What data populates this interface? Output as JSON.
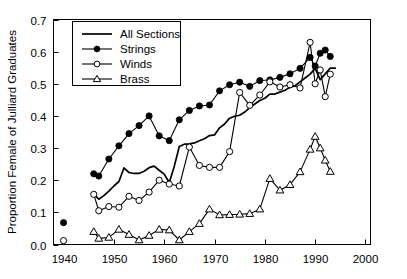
{
  "chart_data": {
    "type": "line",
    "title": "",
    "xlabel": "",
    "ylabel": "Proportion Female of Julliard Graduates",
    "xlim": [
      1938,
      2001
    ],
    "ylim": [
      0.0,
      0.7
    ],
    "grid": false,
    "legend_position": "top-left-inside",
    "x_ticks": [
      1940,
      1950,
      1960,
      1970,
      1980,
      1990,
      2000
    ],
    "x_tick_labels": [
      "1940",
      "1950",
      "1960",
      "1970",
      "1980",
      "1990",
      "2000"
    ],
    "y_ticks": [
      0.0,
      0.1,
      0.2,
      0.3,
      0.4,
      0.5,
      0.6,
      0.7
    ],
    "y_tick_labels": [
      "0.0",
      "0.1",
      "0.2",
      "0.3",
      "0.4",
      "0.5",
      "0.6",
      "0.7"
    ],
    "series": [
      {
        "name": "All Sections",
        "marker": "none",
        "x": [
          1946,
          1947,
          1948,
          1949,
          1950,
          1951,
          1952,
          1953,
          1954,
          1955,
          1956,
          1957,
          1958,
          1959,
          1960,
          1961,
          1962,
          1963,
          1964,
          1965,
          1966,
          1967,
          1968,
          1969,
          1970,
          1971,
          1972,
          1973,
          1974,
          1975,
          1976,
          1977,
          1978,
          1979,
          1980,
          1981,
          1982,
          1983,
          1984,
          1985,
          1986,
          1987,
          1988,
          1989,
          1990,
          1991,
          1992,
          1993,
          1994
        ],
        "y": [
          0.157,
          0.141,
          0.152,
          0.166,
          0.182,
          0.196,
          0.238,
          0.224,
          0.221,
          0.221,
          0.228,
          0.239,
          0.244,
          0.231,
          0.219,
          0.193,
          0.243,
          0.305,
          0.312,
          0.313,
          0.316,
          0.323,
          0.329,
          0.339,
          0.341,
          0.363,
          0.375,
          0.393,
          0.399,
          0.402,
          0.412,
          0.426,
          0.437,
          0.448,
          0.455,
          0.468,
          0.468,
          0.474,
          0.48,
          0.489,
          0.494,
          0.506,
          0.518,
          0.53,
          0.548,
          0.513,
          0.531,
          0.549,
          0.549
        ]
      },
      {
        "name": "Strings",
        "marker": "filled-circle",
        "x": [
          1940,
          1946,
          1947,
          1949,
          1951,
          1953,
          1955,
          1957,
          1959,
          1961,
          1963,
          1965,
          1967,
          1969,
          1971,
          1973,
          1975,
          1977,
          1979,
          1981,
          1983,
          1985,
          1987,
          1989,
          1990,
          1991,
          1992,
          1993
        ],
        "y": [
          0.068,
          0.22,
          0.213,
          0.266,
          0.307,
          0.345,
          0.37,
          0.4,
          0.338,
          0.323,
          0.388,
          0.417,
          0.431,
          0.434,
          0.478,
          0.497,
          0.505,
          0.492,
          0.51,
          0.512,
          0.52,
          0.531,
          0.548,
          0.582,
          0.555,
          0.595,
          0.605,
          0.585
        ]
      },
      {
        "name": "Winds",
        "marker": "open-circle",
        "x": [
          1940,
          1946,
          1947,
          1949,
          1951,
          1953,
          1955,
          1957,
          1959,
          1961,
          1963,
          1965,
          1967,
          1969,
          1971,
          1973,
          1975,
          1977,
          1979,
          1981,
          1983,
          1985,
          1987,
          1989,
          1990,
          1991,
          1992,
          1993
        ],
        "y": [
          0.012,
          0.156,
          0.105,
          0.118,
          0.116,
          0.15,
          0.137,
          0.163,
          0.2,
          0.188,
          0.182,
          0.303,
          0.246,
          0.24,
          0.24,
          0.289,
          0.473,
          0.433,
          0.465,
          0.506,
          0.49,
          0.497,
          0.487,
          0.629,
          0.5,
          0.543,
          0.46,
          0.53
        ]
      },
      {
        "name": "Brass",
        "marker": "open-triangle",
        "x": [
          1946,
          1947,
          1949,
          1951,
          1953,
          1955,
          1957,
          1959,
          1961,
          1963,
          1965,
          1967,
          1969,
          1971,
          1973,
          1975,
          1977,
          1979,
          1981,
          1983,
          1985,
          1987,
          1989,
          1990,
          1991,
          1992,
          1993
        ],
        "y": [
          0.04,
          0.019,
          0.022,
          0.047,
          0.031,
          0.014,
          0.028,
          0.047,
          0.045,
          0.014,
          0.04,
          0.065,
          0.11,
          0.092,
          0.093,
          0.094,
          0.096,
          0.11,
          0.205,
          0.169,
          0.186,
          0.226,
          0.296,
          0.336,
          0.3,
          0.262,
          0.227
        ]
      }
    ]
  },
  "legend": {
    "entries": [
      {
        "label": "All Sections",
        "marker": "none"
      },
      {
        "label": "Strings",
        "marker": "filled-circle"
      },
      {
        "label": "Winds",
        "marker": "open-circle"
      },
      {
        "label": "Brass",
        "marker": "open-triangle"
      }
    ]
  },
  "footer": {
    "text": ""
  }
}
